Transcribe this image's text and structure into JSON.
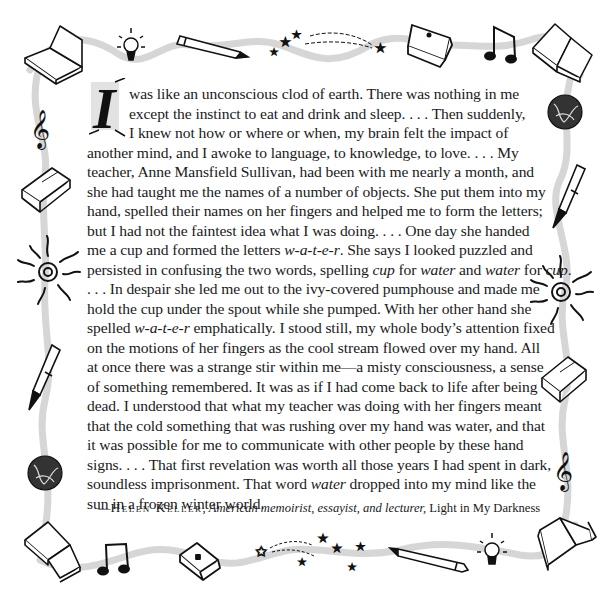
{
  "quote": {
    "drop_cap": "I",
    "lines": [
      {
        "parts": [
          {
            "t": "was like an unconscious clod of earth. There was nothing in me"
          }
        ],
        "indent": true
      },
      {
        "parts": [
          {
            "t": "except the instinct to eat and drink and sleep. . . . Then suddenly,"
          }
        ],
        "indent": true
      },
      {
        "parts": [
          {
            "t": "I knew not how or where or when, my brain felt the impact of"
          }
        ],
        "indent": true
      },
      {
        "parts": [
          {
            "t": "another mind, and I awoke to language, to knowledge, to love. . . . My"
          }
        ]
      },
      {
        "parts": [
          {
            "t": "teacher, Anne Mansfield Sullivan, had been with me nearly a month, and"
          }
        ]
      },
      {
        "parts": [
          {
            "t": "she had taught me the names of a number of objects. She put them into my"
          }
        ]
      },
      {
        "parts": [
          {
            "t": "hand, spelled their names on her fingers and helped me to form the letters;"
          }
        ]
      },
      {
        "parts": [
          {
            "t": "but I had not the faintest idea what I was doing. . . . One day she handed"
          }
        ]
      },
      {
        "parts": [
          {
            "t": "me a cup and formed the letters "
          },
          {
            "t": "w-a-t-e-r",
            "i": true
          },
          {
            "t": ". She says I looked puzzled and"
          }
        ]
      },
      {
        "parts": [
          {
            "t": "persisted in confusing the two words, spelling "
          },
          {
            "t": "cup",
            "i": true
          },
          {
            "t": " for "
          },
          {
            "t": "water",
            "i": true
          },
          {
            "t": " and "
          },
          {
            "t": "water",
            "i": true
          },
          {
            "t": " for "
          },
          {
            "t": "cup",
            "i": true
          },
          {
            "t": "."
          }
        ]
      },
      {
        "parts": [
          {
            "t": ". . . In despair she led me out to the ivy-covered pumphouse and made me"
          }
        ]
      },
      {
        "parts": [
          {
            "t": "hold the cup under the spout while she pumped. With her other hand she"
          }
        ]
      },
      {
        "parts": [
          {
            "t": "spelled "
          },
          {
            "t": "w-a-t-e-r",
            "i": true
          },
          {
            "t": " emphatically. I stood still, my whole body’s attention fixed"
          }
        ]
      },
      {
        "parts": [
          {
            "t": "on the motions of her fingers as the cool stream flowed over my hand. All"
          }
        ]
      },
      {
        "parts": [
          {
            "t": "at once there was a strange stir within me—a misty consciousness, a sense"
          }
        ]
      },
      {
        "parts": [
          {
            "t": "of something remembered. It was as if I had come back to life after being"
          }
        ]
      },
      {
        "parts": [
          {
            "t": "dead. I understood that what my teacher was doing with her fingers meant"
          }
        ]
      },
      {
        "parts": [
          {
            "t": "that the cold something that was rushing over my hand was water, and that"
          }
        ]
      },
      {
        "parts": [
          {
            "t": "it was possible for me to communicate with other people by these hand"
          }
        ]
      },
      {
        "parts": [
          {
            "t": "signs. . . . That first revelation was worth all those years I had spent in dark,"
          }
        ]
      },
      {
        "parts": [
          {
            "t": "soundless imprisonment. That word "
          },
          {
            "t": "water",
            "i": true
          },
          {
            "t": " dropped into my mind like the"
          }
        ]
      },
      {
        "parts": [
          {
            "t": "sun in a frozen winter world."
          }
        ]
      }
    ]
  },
  "attribution": {
    "dash": "—",
    "author": "Helen Keller",
    "separator": ", ",
    "description": "American memoirist, essayist, and lecturer,",
    "work": " Light in My Darkness"
  },
  "border": {
    "top_icons": [
      "open-book",
      "light-bulb",
      "pencil",
      "shooting-stars",
      "closed-book",
      "music-note",
      "open-book"
    ],
    "left_icons": [
      "treble-clef",
      "closed-book",
      "spiral-sun",
      "fountain-pen",
      "globe"
    ],
    "right_icons": [
      "globe",
      "fountain-pen",
      "spiral-sun",
      "closed-book",
      "treble-clef"
    ],
    "bottom_icons": [
      "open-book",
      "music-note",
      "closed-book",
      "shooting-stars",
      "pencil",
      "light-bulb",
      "open-book"
    ],
    "ribbon_color": "#cfcfcf",
    "ink_color": "#111111"
  }
}
